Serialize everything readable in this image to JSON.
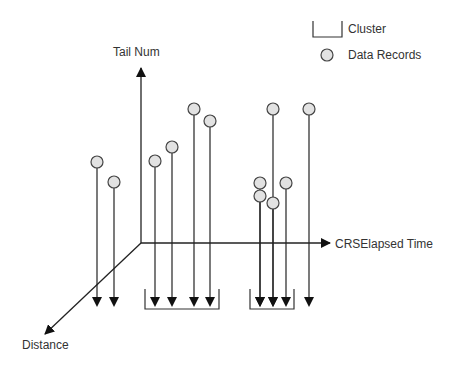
{
  "diagram": {
    "type": "3d-axis-clustering-illustration",
    "axes": {
      "vertical": {
        "label": "Tail Num"
      },
      "horizontal": {
        "label": "CRSElapsed Time"
      },
      "depth": {
        "label": "Distance"
      }
    },
    "legend": {
      "items": [
        {
          "symbol": "bracket",
          "label": "Cluster"
        },
        {
          "symbol": "circle",
          "label": "Data Records"
        }
      ]
    },
    "colors": {
      "line": "#222222",
      "circle_fill": "#e2e2e2",
      "circle_stroke": "#444444",
      "text": "#333333"
    },
    "data_records": [
      {
        "x": 97,
        "y": 162,
        "group": "unclustered"
      },
      {
        "x": 114,
        "y": 182,
        "group": "unclustered"
      },
      {
        "x": 155,
        "y": 161,
        "group": "cluster-1"
      },
      {
        "x": 172,
        "y": 147,
        "group": "cluster-1"
      },
      {
        "x": 194,
        "y": 109,
        "group": "cluster-1"
      },
      {
        "x": 210,
        "y": 121,
        "group": "cluster-1"
      },
      {
        "x": 260,
        "y": 183,
        "group": "cluster-2"
      },
      {
        "x": 260,
        "y": 196,
        "group": "cluster-2"
      },
      {
        "x": 273,
        "y": 203,
        "group": "cluster-2"
      },
      {
        "x": 286,
        "y": 183,
        "group": "cluster-2"
      },
      {
        "x": 273,
        "y": 109,
        "group": "unclustered"
      },
      {
        "x": 309,
        "y": 109,
        "group": "unclustered"
      }
    ],
    "clusters": [
      {
        "name": "cluster-1",
        "x1": 145,
        "x2": 219
      },
      {
        "name": "cluster-2",
        "x1": 250,
        "x2": 294
      }
    ]
  }
}
